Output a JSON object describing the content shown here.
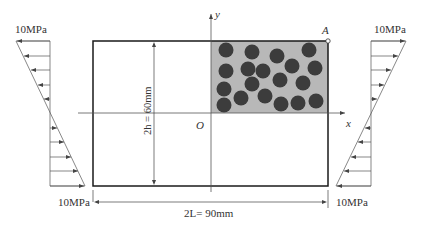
{
  "diagram": {
    "stress_labels": {
      "left_top": "10MPa",
      "left_bottom": "10MPa",
      "right_top": "10MPa",
      "right_bottom": "10MPa"
    },
    "dimensions": {
      "height_label": "2h = 60mm",
      "width_label": "2L= 90mm"
    },
    "axes": {
      "x_label": "x",
      "y_label": "y",
      "origin_label": "O"
    },
    "point_label": "A",
    "colors": {
      "frame": "#1a1a1a",
      "shaded_region": "#b3b3b3",
      "particles": "#3c3c3c",
      "lines": "#555555"
    },
    "particles": [
      {
        "cx": 226,
        "cy": 50
      },
      {
        "cx": 252,
        "cy": 52
      },
      {
        "cx": 277,
        "cy": 56
      },
      {
        "cx": 309,
        "cy": 50
      },
      {
        "cx": 226,
        "cy": 71
      },
      {
        "cx": 248,
        "cy": 69
      },
      {
        "cx": 263,
        "cy": 71
      },
      {
        "cx": 292,
        "cy": 66
      },
      {
        "cx": 315,
        "cy": 68
      },
      {
        "cx": 224,
        "cy": 89
      },
      {
        "cx": 252,
        "cy": 84
      },
      {
        "cx": 280,
        "cy": 80
      },
      {
        "cx": 303,
        "cy": 83
      },
      {
        "cx": 224,
        "cy": 105
      },
      {
        "cx": 241,
        "cy": 98
      },
      {
        "cx": 265,
        "cy": 96
      },
      {
        "cx": 281,
        "cy": 104
      },
      {
        "cx": 298,
        "cy": 103
      },
      {
        "cx": 316,
        "cy": 101
      }
    ]
  }
}
